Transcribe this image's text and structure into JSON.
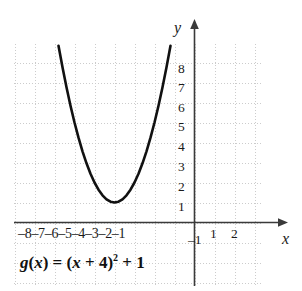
{
  "figure": {
    "background_color": "#ffffff",
    "grid_color": "#c9c9c9",
    "axis_color": "#3a3a3a",
    "curve_color": "#111111"
  },
  "axes": {
    "x_axis_name": "x",
    "y_axis_name": "y",
    "x_tick_labels": [
      "–8",
      "–7",
      "–6",
      "–5",
      "–4",
      "–3",
      "–2",
      "–1",
      "1",
      "2"
    ],
    "y_tick_labels": [
      "8",
      "7",
      "6",
      "5",
      "4",
      "3",
      "2",
      "1"
    ],
    "negative_y_tick_label": "–1"
  },
  "equation": {
    "full_text": "g(x) = (x + 4)² + 1",
    "func_name": "g",
    "open_paren": "(",
    "arg": "x",
    "close_paren": ")",
    "equals": " = (",
    "inner_var": "x",
    "plus_four": " + 4)",
    "exponent": "2",
    "plus_one": " + 1"
  },
  "chart_data": {
    "type": "line",
    "title": "",
    "xlabel": "x",
    "ylabel": "y",
    "equation": "g(x) = (x + 4)^2 + 1",
    "vertex": [
      -4,
      1
    ],
    "xlim": [
      -9.05,
      3.45
    ],
    "ylim": [
      -2.0,
      10.15
    ],
    "xticks": [
      -8,
      -7,
      -6,
      -5,
      -4,
      -3,
      -2,
      -1,
      1,
      2
    ],
    "yticks": [
      1,
      2,
      3,
      4,
      5,
      6,
      7,
      8
    ],
    "grid": true,
    "grid_style": "dotted",
    "legend": "none",
    "x": [
      -6.8,
      -6.6,
      -6.4,
      -6.2,
      -6.0,
      -5.8,
      -5.6,
      -5.4,
      -5.2,
      -5.0,
      -4.8,
      -4.6,
      -4.4,
      -4.2,
      -4.0,
      -3.8,
      -3.6,
      -3.4,
      -3.2,
      -3.0,
      -2.8,
      -2.6,
      -2.4,
      -2.2,
      -2.0,
      -1.8,
      -1.6,
      -1.4,
      -1.2
    ],
    "y": [
      8.84,
      7.76,
      6.76,
      5.84,
      5.0,
      4.24,
      3.56,
      2.96,
      2.44,
      2.0,
      1.64,
      1.36,
      1.16,
      1.04,
      1.0,
      1.04,
      1.16,
      1.36,
      1.64,
      2.0,
      2.44,
      2.96,
      3.56,
      4.24,
      5.0,
      5.84,
      6.76,
      7.76,
      8.84
    ]
  }
}
